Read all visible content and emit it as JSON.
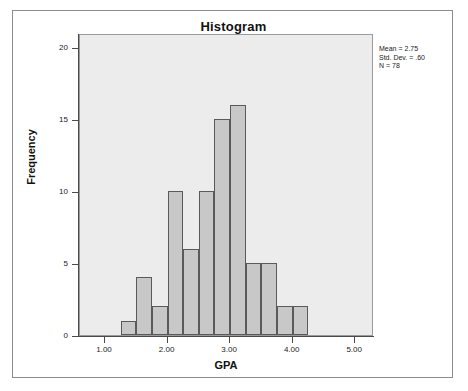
{
  "chart_data": {
    "type": "bar",
    "title": "Histogram",
    "xlabel": "GPA",
    "ylabel": "Frequency",
    "xlim": [
      0.6,
      5.3
    ],
    "ylim": [
      0,
      21
    ],
    "grid": false,
    "legend": null,
    "bin_width": 0.25,
    "bin_starts": [
      1.25,
      1.5,
      1.75,
      2.0,
      2.25,
      2.5,
      2.75,
      3.0,
      3.25,
      3.5,
      3.75,
      4.0
    ],
    "categories": [
      "1.25",
      "1.50",
      "1.75",
      "2.00",
      "2.25",
      "2.50",
      "2.75",
      "3.00",
      "3.25",
      "3.50",
      "3.75",
      "4.00"
    ],
    "values": [
      1,
      4,
      2,
      10,
      6,
      10,
      15,
      16,
      5,
      5,
      2,
      2
    ],
    "x_ticks": [
      "1.00",
      "2.00",
      "3.00",
      "4.00",
      "5.00"
    ],
    "x_tick_values": [
      1.0,
      2.0,
      3.0,
      4.0,
      5.0
    ],
    "y_ticks": [
      "0",
      "5",
      "10",
      "15",
      "20"
    ],
    "y_tick_values": [
      0,
      5,
      10,
      15,
      20
    ],
    "bar_fill_color": "#c8c8c8",
    "bar_border_color": "#5a5a5a",
    "plot_background_color": "#ececec",
    "annotations": {
      "mean": "Mean = 2.75",
      "std_dev": "Std. Dev. = .60",
      "n": "N = 78"
    }
  }
}
